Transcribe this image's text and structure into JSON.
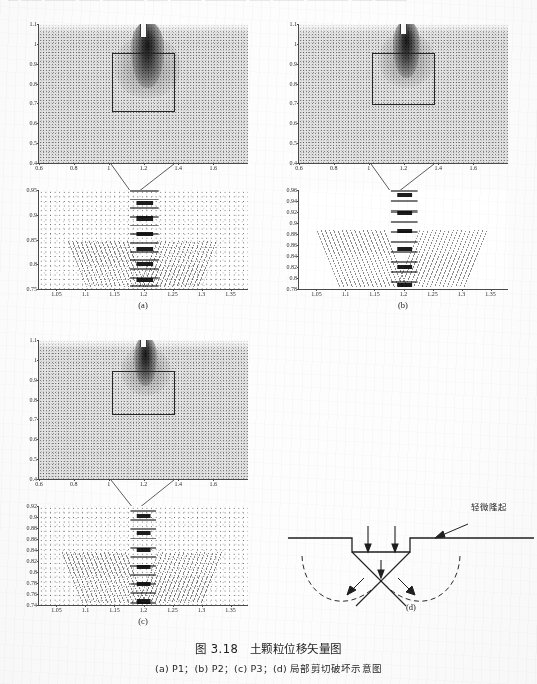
{
  "page": {
    "top_cut_text": "— —— ——— —— ———— —— ——— ———— —— ——— ———— —— ———"
  },
  "caption": {
    "main": "图 3.18　土颗粒位移矢量图",
    "sub": "(a) P1；(b) P2；(c) P3；(d) 局部剪切破坏示意图"
  },
  "panels": {
    "a": {
      "label": "(a)",
      "overview": {
        "yticks": [
          "0.4",
          "0.5",
          "0.6",
          "0.7",
          "0.8",
          "0.9",
          "1",
          "1.1"
        ],
        "yvals": [
          0.4,
          0.5,
          0.6,
          0.7,
          0.8,
          0.9,
          1.0,
          1.1
        ],
        "ylim": [
          0.4,
          1.1
        ],
        "xticks": [
          "0.6",
          "0.8",
          "1",
          "1.2",
          "1.4",
          "1.6"
        ],
        "xvals": [
          0.6,
          0.8,
          1.0,
          1.2,
          1.4,
          1.6
        ],
        "xlim": [
          0.6,
          1.8
        ]
      },
      "detail": {
        "yticks": [
          "0.75",
          "0.8",
          "0.85",
          "0.9",
          "0.95"
        ],
        "yvals": [
          0.75,
          0.8,
          0.85,
          0.9,
          0.95
        ],
        "ylim": [
          0.75,
          0.95
        ],
        "xticks": [
          "1.05",
          "1.1",
          "1.15",
          "1.2",
          "1.25",
          "1.3",
          "1.35"
        ],
        "xvals": [
          1.05,
          1.1,
          1.15,
          1.2,
          1.25,
          1.3,
          1.35
        ],
        "xlim": [
          1.02,
          1.38
        ]
      }
    },
    "b": {
      "label": "(b)",
      "overview": {
        "yticks": [
          "0.4",
          "0.5",
          "0.6",
          "0.7",
          "0.8",
          "0.9",
          "1",
          "1.1"
        ],
        "yvals": [
          0.4,
          0.5,
          0.6,
          0.7,
          0.8,
          0.9,
          1.0,
          1.1
        ],
        "ylim": [
          0.4,
          1.1
        ],
        "xticks": [
          "0.6",
          "0.8",
          "1",
          "1.2",
          "1.4",
          "1.6"
        ],
        "xvals": [
          0.6,
          0.8,
          1.0,
          1.2,
          1.4,
          1.6
        ],
        "xlim": [
          0.6,
          1.8
        ]
      },
      "detail": {
        "yticks": [
          "0.78",
          "0.8",
          "0.82",
          "0.84",
          "0.86",
          "0.88",
          "0.9",
          "0.92",
          "0.94",
          "0.96"
        ],
        "yvals": [
          0.78,
          0.8,
          0.82,
          0.84,
          0.86,
          0.88,
          0.9,
          0.92,
          0.94,
          0.96
        ],
        "ylim": [
          0.78,
          0.96
        ],
        "xticks": [
          "1.05",
          "1.1",
          "1.15",
          "1.2",
          "1.25",
          "1.3",
          "1.35"
        ],
        "xvals": [
          1.05,
          1.1,
          1.15,
          1.2,
          1.25,
          1.3,
          1.35
        ],
        "xlim": [
          1.02,
          1.38
        ]
      }
    },
    "c": {
      "label": "(c)",
      "overview": {
        "yticks": [
          "0.4",
          "0.5",
          "0.6",
          "0.7",
          "0.8",
          "0.9",
          "1",
          "1.1"
        ],
        "yvals": [
          0.4,
          0.5,
          0.6,
          0.7,
          0.8,
          0.9,
          1.0,
          1.1
        ],
        "ylim": [
          0.4,
          1.1
        ],
        "xticks": [
          "0.6",
          "0.8",
          "1",
          "1.2",
          "1.4",
          "1.6"
        ],
        "xvals": [
          0.6,
          0.8,
          1.0,
          1.2,
          1.4,
          1.6
        ],
        "xlim": [
          0.6,
          1.8
        ]
      },
      "detail": {
        "yticks": [
          "0.74",
          "0.76",
          "0.78",
          "0.8",
          "0.82",
          "0.84",
          "0.86",
          "0.88",
          "0.9",
          "0.92"
        ],
        "yvals": [
          0.74,
          0.76,
          0.78,
          0.8,
          0.82,
          0.84,
          0.86,
          0.88,
          0.9,
          0.92
        ],
        "ylim": [
          0.74,
          0.92
        ],
        "xticks": [
          "1.05",
          "1.1",
          "1.15",
          "1.2",
          "1.25",
          "1.3",
          "1.35"
        ],
        "xvals": [
          1.05,
          1.1,
          1.15,
          1.2,
          1.25,
          1.3,
          1.35
        ],
        "xlim": [
          1.02,
          1.38
        ]
      }
    },
    "d": {
      "label": "(d)",
      "annotation": "轻微隆起"
    }
  },
  "chart_data": {
    "type": "scatter",
    "title": "图 3.18　土颗粒位移矢量图",
    "subplots": [
      {
        "id": "a-overview",
        "case": "P1",
        "xlabel": "",
        "ylabel": "",
        "xlim": [
          0.6,
          1.8
        ],
        "ylim": [
          0.4,
          1.1
        ],
        "xticks": [
          0.6,
          0.8,
          1.0,
          1.2,
          1.4,
          1.6
        ],
        "yticks": [
          0.4,
          0.5,
          0.6,
          0.7,
          0.8,
          0.9,
          1.0,
          1.1
        ],
        "grid": false,
        "annotations": [
          {
            "type": "zoom-rect",
            "x0": 1.02,
            "x1": 1.38,
            "y0": 0.66,
            "y1": 0.95
          },
          {
            "type": "penetrator",
            "x": 1.2,
            "y_top": 1.1,
            "y_tip": 1.02
          }
        ]
      },
      {
        "id": "a-detail",
        "case": "P1",
        "xlim": [
          1.02,
          1.38
        ],
        "ylim": [
          0.75,
          0.95
        ],
        "xticks": [
          1.05,
          1.1,
          1.15,
          1.2,
          1.25,
          1.3,
          1.35
        ],
        "yticks": [
          0.75,
          0.8,
          0.85,
          0.9,
          0.95
        ],
        "grid": false
      },
      {
        "id": "b-overview",
        "case": "P2",
        "xlim": [
          0.6,
          1.8
        ],
        "ylim": [
          0.4,
          1.1
        ],
        "xticks": [
          0.6,
          0.8,
          1.0,
          1.2,
          1.4,
          1.6
        ],
        "yticks": [
          0.4,
          0.5,
          0.6,
          0.7,
          0.8,
          0.9,
          1.0,
          1.1
        ],
        "grid": false,
        "annotations": [
          {
            "type": "zoom-rect",
            "x0": 1.02,
            "x1": 1.38,
            "y0": 0.7,
            "y1": 0.95
          }
        ]
      },
      {
        "id": "b-detail",
        "case": "P2",
        "xlim": [
          1.02,
          1.38
        ],
        "ylim": [
          0.78,
          0.96
        ],
        "xticks": [
          1.05,
          1.1,
          1.15,
          1.2,
          1.25,
          1.3,
          1.35
        ],
        "yticks": [
          0.78,
          0.8,
          0.82,
          0.84,
          0.86,
          0.88,
          0.9,
          0.92,
          0.94,
          0.96
        ],
        "grid": false
      },
      {
        "id": "c-overview",
        "case": "P3",
        "xlim": [
          0.6,
          1.8
        ],
        "ylim": [
          0.4,
          1.1
        ],
        "xticks": [
          0.6,
          0.8,
          1.0,
          1.2,
          1.4,
          1.6
        ],
        "yticks": [
          0.4,
          0.5,
          0.6,
          0.7,
          0.8,
          0.9,
          1.0,
          1.1
        ],
        "grid": false,
        "annotations": [
          {
            "type": "zoom-rect",
            "x0": 1.02,
            "x1": 1.38,
            "y0": 0.72,
            "y1": 0.93
          }
        ]
      },
      {
        "id": "c-detail",
        "case": "P3",
        "xlim": [
          1.02,
          1.38
        ],
        "ylim": [
          0.74,
          0.92
        ],
        "xticks": [
          1.05,
          1.1,
          1.15,
          1.2,
          1.25,
          1.3,
          1.35
        ],
        "yticks": [
          0.74,
          0.76,
          0.78,
          0.8,
          0.82,
          0.84,
          0.86,
          0.88,
          0.9,
          0.92
        ],
        "grid": false
      },
      {
        "id": "d-schematic",
        "type": "diagram",
        "labels": [
          "轻微隆起"
        ]
      }
    ]
  }
}
